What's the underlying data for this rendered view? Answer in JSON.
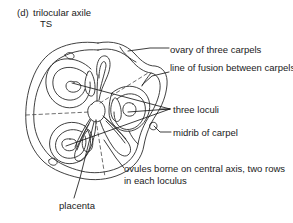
{
  "figure": {
    "index": "(d)",
    "title": "trilocular axile",
    "section": "TS"
  },
  "labels": {
    "ovary": "ovary of three carpels",
    "fusion": "line of fusion between carpels",
    "loculi": "three loculi",
    "midrib": "midrib of carpel",
    "ovules": "ovules borne on central axis, two rows in each loculus",
    "placenta": "placenta"
  },
  "colors": {
    "ink": "#1a1a1a",
    "outline": "#2b2b2b",
    "background": "#ffffff"
  },
  "diagram": {
    "type": "botanical-cross-section",
    "carpel_count": 3,
    "loculus_count": 3,
    "ovule_rows_per_loculus": 2,
    "placentation": "axile"
  }
}
